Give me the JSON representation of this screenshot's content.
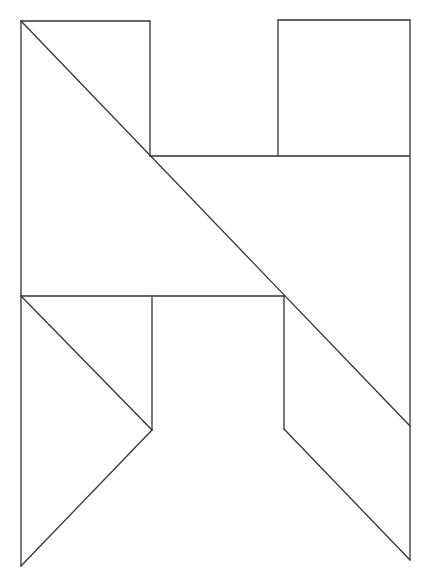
{
  "diagram": {
    "type": "tangram-figure",
    "stroke_color": "#333333",
    "background": "#ffffff",
    "segments": [
      {
        "name": "top-left-rect-top",
        "x1": 21,
        "y1": 21,
        "x2": 150,
        "y2": 21
      },
      {
        "name": "top-left-rect-right",
        "x1": 150,
        "y1": 21,
        "x2": 150,
        "y2": 156
      },
      {
        "name": "left-outer-edge",
        "x1": 21,
        "y1": 21,
        "x2": 21,
        "y2": 566
      },
      {
        "name": "long-diagonal",
        "x1": 21,
        "y1": 21,
        "x2": 410,
        "y2": 426
      },
      {
        "name": "top-right-square-top",
        "x1": 278,
        "y1": 20,
        "x2": 410,
        "y2": 20
      },
      {
        "name": "top-right-square-left",
        "x1": 278,
        "y1": 20,
        "x2": 278,
        "y2": 156
      },
      {
        "name": "right-outer-edge",
        "x1": 410,
        "y1": 20,
        "x2": 410,
        "y2": 560
      },
      {
        "name": "middle-upper-horizontal",
        "x1": 150,
        "y1": 156,
        "x2": 410,
        "y2": 156
      },
      {
        "name": "middle-lower-horizontal",
        "x1": 21,
        "y1": 296,
        "x2": 284,
        "y2": 296
      },
      {
        "name": "left-leg-inner-vertical",
        "x1": 152,
        "y1": 296,
        "x2": 152,
        "y2": 430
      },
      {
        "name": "left-leg-diagonal-upper",
        "x1": 21,
        "y1": 296,
        "x2": 152,
        "y2": 430
      },
      {
        "name": "left-leg-diagonal-lower",
        "x1": 152,
        "y1": 430,
        "x2": 21,
        "y2": 566
      },
      {
        "name": "right-leg-inner-vertical",
        "x1": 284,
        "y1": 296,
        "x2": 284,
        "y2": 429
      },
      {
        "name": "right-leg-diagonal-lower",
        "x1": 284,
        "y1": 429,
        "x2": 410,
        "y2": 560
      }
    ]
  }
}
